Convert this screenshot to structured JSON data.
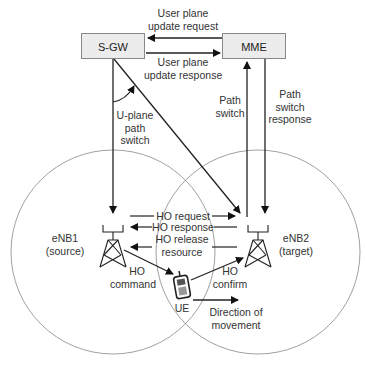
{
  "nodes": {
    "sgw": "S-GW",
    "mme": "MME",
    "enb1_line1": "eNB1",
    "enb1_line2": "(source)",
    "enb2_line1": "eNB2",
    "enb2_line2": "(target)",
    "ue": "UE"
  },
  "messages": {
    "up_update_request_1": "User plane",
    "up_update_request_2": "update request",
    "up_update_response_1": "User plane",
    "up_update_response_2": "update response",
    "uplane_path_switch_1": "U-plane",
    "uplane_path_switch_2": "path",
    "uplane_path_switch_3": "switch",
    "path_switch_1": "Path",
    "path_switch_2": "switch",
    "path_switch_response_1": "Path",
    "path_switch_response_2": "switch",
    "path_switch_response_3": "response",
    "ho_request": "HO request",
    "ho_response": "HO response",
    "ho_release_1": "HO release",
    "ho_release_2": "resource",
    "ho_command_1": "HO",
    "ho_command_2": "command",
    "ho_confirm_1": "HO",
    "ho_confirm_2": "confirm",
    "direction_1": "Direction of",
    "direction_2": "movement"
  },
  "colors": {
    "box_fill": "#ececec",
    "line": "#222222",
    "circle": "#888888"
  }
}
